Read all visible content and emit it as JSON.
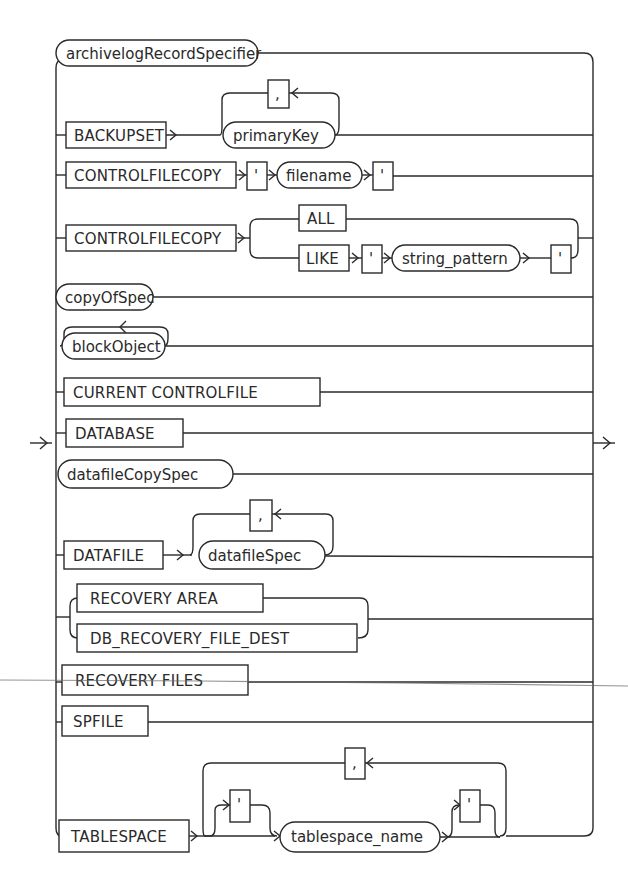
{
  "diagram": {
    "type": "railroad-syntax-diagram",
    "entry_arrow": "right-arrow",
    "exit_arrow": "right-arrow",
    "colors": {
      "stroke": "#2a2a2a",
      "background": "#ffffff"
    },
    "branches": [
      {
        "id": "archivelog",
        "items": [
          {
            "kind": "nonterminal",
            "text": "archivelogRecordSpecifier"
          }
        ]
      },
      {
        "id": "backupset",
        "items": [
          {
            "kind": "keyword",
            "text": "BACKUPSET"
          },
          {
            "kind": "nonterminal",
            "text": "primaryKey"
          }
        ],
        "repeat_separator": ","
      },
      {
        "id": "controlfilecopy-filename",
        "items": [
          {
            "kind": "keyword",
            "text": "CONTROLFILECOPY"
          },
          {
            "kind": "punct",
            "text": "'"
          },
          {
            "kind": "nonterminal",
            "text": "filename"
          },
          {
            "kind": "punct",
            "text": "'"
          }
        ]
      },
      {
        "id": "controlfilecopy-choice",
        "items": [
          {
            "kind": "keyword",
            "text": "CONTROLFILECOPY"
          }
        ],
        "choices": [
          {
            "items": [
              {
                "kind": "keyword",
                "text": "ALL"
              }
            ]
          },
          {
            "items": [
              {
                "kind": "keyword",
                "text": "LIKE"
              },
              {
                "kind": "punct",
                "text": "'"
              },
              {
                "kind": "nonterminal",
                "text": "string_pattern"
              },
              {
                "kind": "punct",
                "text": "'"
              }
            ]
          }
        ]
      },
      {
        "id": "copyofspec",
        "items": [
          {
            "kind": "nonterminal",
            "text": "copyOfSpec"
          }
        ]
      },
      {
        "id": "blockobject",
        "items": [
          {
            "kind": "nonterminal",
            "text": "blockObject"
          }
        ],
        "repeat_separator": ""
      },
      {
        "id": "current-controlfile",
        "items": [
          {
            "kind": "keyword",
            "text": "CURRENT CONTROLFILE"
          }
        ]
      },
      {
        "id": "database",
        "items": [
          {
            "kind": "keyword",
            "text": "DATABASE"
          }
        ]
      },
      {
        "id": "datafilecopyspec",
        "items": [
          {
            "kind": "nonterminal",
            "text": "datafileCopySpec"
          }
        ]
      },
      {
        "id": "datafile",
        "items": [
          {
            "kind": "keyword",
            "text": "DATAFILE"
          },
          {
            "kind": "nonterminal",
            "text": "datafileSpec"
          }
        ],
        "repeat_separator": ","
      },
      {
        "id": "recovery-area-choice",
        "choices": [
          {
            "items": [
              {
                "kind": "keyword",
                "text": "RECOVERY AREA"
              }
            ]
          },
          {
            "items": [
              {
                "kind": "keyword",
                "text": "DB_RECOVERY_FILE_DEST"
              }
            ]
          }
        ]
      },
      {
        "id": "recovery-files",
        "items": [
          {
            "kind": "keyword",
            "text": "RECOVERY FILES"
          }
        ]
      },
      {
        "id": "spfile",
        "items": [
          {
            "kind": "keyword",
            "text": "SPFILE"
          }
        ]
      },
      {
        "id": "tablespace",
        "items": [
          {
            "kind": "keyword",
            "text": "TABLESPACE"
          },
          {
            "kind": "optional-punct",
            "text": "'"
          },
          {
            "kind": "nonterminal",
            "text": "tablespace_name"
          },
          {
            "kind": "optional-punct",
            "text": "'"
          }
        ],
        "repeat_separator": ","
      }
    ]
  },
  "labels": {
    "archivelog": "archivelogRecordSpecifier",
    "backupset": "BACKUPSET",
    "primaryKey": "primaryKey",
    "comma": ",",
    "quote": "'",
    "controlfilecopy": "CONTROLFILECOPY",
    "filename": "filename",
    "all": "ALL",
    "like": "LIKE",
    "string_pattern": "string_pattern",
    "copyOfSpec": "copyOfSpec",
    "blockObject": "blockObject",
    "current_controlfile": "CURRENT CONTROLFILE",
    "database": "DATABASE",
    "datafileCopySpec": "datafileCopySpec",
    "datafile": "DATAFILE",
    "datafileSpec": "datafileSpec",
    "recovery_area": "RECOVERY AREA",
    "db_recovery_file_dest": "DB_RECOVERY_FILE_DEST",
    "recovery_files": "RECOVERY FILES",
    "spfile": "SPFILE",
    "tablespace": "TABLESPACE",
    "tablespace_name": "tablespace_name"
  }
}
